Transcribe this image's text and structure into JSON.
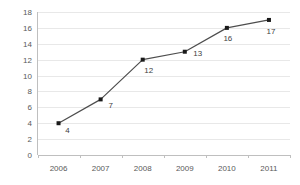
{
  "chart_data": {
    "type": "line",
    "title": "",
    "subtitle": "",
    "xlabel": "",
    "ylabel": "",
    "categories": [
      "2006",
      "2007",
      "2008",
      "2009",
      "2010",
      "2011"
    ],
    "values": [
      4,
      7,
      12,
      13,
      16,
      17
    ],
    "point_labels": [
      "4",
      "7",
      "12",
      "13",
      "16",
      "17"
    ],
    "series": [
      {
        "name": "",
        "values": [
          4,
          7,
          12,
          13,
          16,
          17
        ]
      }
    ],
    "ylim": [
      0,
      18
    ],
    "ytick_values": [
      0,
      2,
      4,
      6,
      8,
      10,
      12,
      14,
      16,
      18
    ],
    "ytick_labels": [
      "0",
      "2",
      "4",
      "6",
      "8",
      "10",
      "12",
      "14",
      "16",
      "18"
    ],
    "xtick_labels": [
      "2006",
      "2007",
      "2008",
      "2009",
      "2010",
      "2011"
    ],
    "grid": true,
    "grid_axis": "y",
    "legend": false,
    "legend_position": "none",
    "marker": "square",
    "data_labels_shown": true,
    "colors": {
      "line": "#4d4d4d",
      "marker": "#1a1a1a",
      "grid": "#e8e8e8",
      "axis": "#bfbfbf",
      "tick_text": "#595959",
      "label_text": "#404040",
      "background": "#ffffff"
    }
  }
}
